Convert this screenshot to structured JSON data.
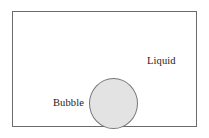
{
  "figure": {
    "type": "schematic-diagram",
    "frame": {
      "border_color": "#6b6b6b",
      "fill_color": "#ffffff"
    },
    "shapes": [
      {
        "name": "bubble",
        "kind": "circle",
        "fill_color": "#e3e3e3",
        "stroke_color": "#767676"
      }
    ],
    "labels": {
      "liquid": "Liquid",
      "bubble": "Bubble"
    },
    "background": "#ffffff"
  }
}
